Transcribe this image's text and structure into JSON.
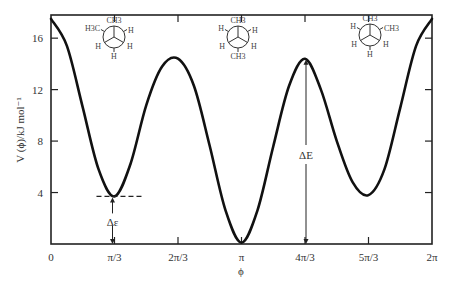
{
  "chart_data": {
    "type": "line",
    "title": "",
    "xlabel": "ϕ",
    "ylabel": "V(ϕ)/kJ mol⁻¹",
    "xlim": [
      0,
      6.2832
    ],
    "ylim": [
      0,
      17.8
    ],
    "grid": false,
    "legend": null,
    "x_ticks": [
      {
        "value": 0,
        "label": "0"
      },
      {
        "value": 1.0472,
        "label": "π/3"
      },
      {
        "value": 2.0944,
        "label": "2π/3"
      },
      {
        "value": 3.1416,
        "label": "π"
      },
      {
        "value": 4.1888,
        "label": "4π/3"
      },
      {
        "value": 5.236,
        "label": "5π/3"
      },
      {
        "value": 6.2832,
        "label": "2π"
      }
    ],
    "y_ticks": [
      {
        "value": 4,
        "label": "4"
      },
      {
        "value": 8,
        "label": "8"
      },
      {
        "value": 12,
        "label": "12"
      },
      {
        "value": 16,
        "label": "16"
      }
    ],
    "series": [
      {
        "name": "V(ϕ)",
        "x": [
          0,
          0.2618,
          0.5236,
          0.7854,
          1.0472,
          1.309,
          1.5708,
          1.8326,
          2.0944,
          2.3562,
          2.618,
          2.8798,
          3.1416,
          3.4034,
          3.6652,
          3.927,
          4.1888,
          4.4506,
          4.7124,
          4.9742,
          5.236,
          5.4978,
          5.7596,
          6.0214,
          6.2832
        ],
        "values": [
          17.5,
          15.4,
          10.6,
          5.8,
          3.7,
          6.2,
          10.8,
          13.8,
          14.4,
          12.3,
          7.6,
          2.6,
          0.1,
          2.6,
          7.6,
          12.3,
          14.4,
          12.0,
          8.0,
          4.8,
          3.8,
          5.8,
          10.6,
          15.4,
          17.5
        ]
      }
    ],
    "annotations": [
      {
        "type": "dashed-line",
        "y": 3.7,
        "x_from": 0.75,
        "x_to": 1.5,
        "label": ""
      },
      {
        "type": "double-arrow",
        "x": 1.0472,
        "y_from": 0,
        "y_to": 3.7,
        "label": "Δε"
      },
      {
        "type": "double-arrow",
        "x": 4.1888,
        "y_from": 0,
        "y_to": 14.4,
        "label": "ΔE"
      }
    ],
    "insets": [
      {
        "name": "gauche-newman",
        "x": 1.0472,
        "front_top": "CH3",
        "front_left": "H",
        "front_right": "H",
        "back_upper_left": "H3C",
        "back_upper_right": "H",
        "back_bottom": "H",
        "labels": [
          "CH3",
          "H3C",
          "H",
          "H",
          "H",
          "H"
        ]
      },
      {
        "name": "anti-newman",
        "x": 3.1416,
        "labels": [
          "CH3",
          "H",
          "H",
          "H",
          "H",
          "CH3"
        ]
      },
      {
        "name": "gauche-newman-2",
        "x": 5.236,
        "labels": [
          "CH3",
          "CH3",
          "H",
          "H",
          "H",
          "H"
        ]
      }
    ]
  },
  "labels": {
    "x_axis_title": "ϕ",
    "y_axis_title": "V (ϕ)/kJ mol⁻¹",
    "delta_small": "Δε",
    "delta_big": "ΔE"
  },
  "newman": {
    "left": {
      "top": "CH3",
      "ul": "H3C",
      "ur": "H",
      "ll": "H",
      "lr": "H",
      "bottom": "H"
    },
    "mid": {
      "top": "CH3",
      "ul": "H",
      "ur": "H",
      "ll": "H",
      "lr": "H",
      "bottom": "CH3"
    },
    "right": {
      "top": "CH3",
      "ul": "H",
      "ur": "CH3",
      "ll": "H",
      "lr": "H",
      "bottom": "H"
    }
  },
  "colors": {
    "curve": "#111111",
    "axis": "#222222",
    "text": "#333333"
  }
}
